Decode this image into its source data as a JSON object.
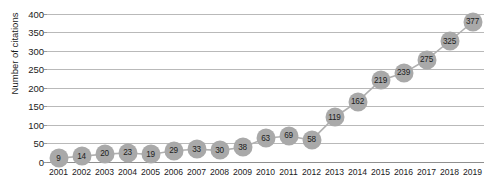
{
  "chart_data": {
    "type": "line",
    "title": "",
    "subtitle": "",
    "xlabel": "",
    "ylabel": "Number of citations",
    "ylim": [
      0,
      400
    ],
    "ytick_step": 50,
    "yticks": [
      "0",
      "50",
      "100",
      "150",
      "200",
      "250",
      "300",
      "350",
      "400"
    ],
    "grid": true,
    "legend": null,
    "legend_position": "none",
    "marker": "circle",
    "data_labels": true,
    "categories": [
      "2001",
      "2002",
      "2003",
      "2004",
      "2005",
      "2006",
      "2007",
      "2008",
      "2009",
      "2010",
      "2011",
      "2012",
      "2013",
      "2014",
      "2015",
      "2016",
      "2017",
      "2018",
      "2019"
    ],
    "values": [
      9,
      14,
      20,
      23,
      19,
      29,
      33,
      30,
      38,
      63,
      69,
      58,
      119,
      162,
      219,
      239,
      275,
      325,
      377
    ],
    "series": [
      {
        "name": "Number of citations",
        "values": [
          9,
          14,
          20,
          23,
          19,
          29,
          33,
          30,
          38,
          63,
          69,
          58,
          119,
          162,
          219,
          239,
          275,
          325,
          377
        ]
      }
    ],
    "colors": {
      "marker_fill": "#a9a9a9",
      "line": "#b0b0b0",
      "gridline": "#b9b9b9",
      "axis": "#8f8f8f",
      "label_text": "#212121",
      "tick_text": "#1b1b1b",
      "background": "#ffffff"
    }
  },
  "watermark": {
    "text": ""
  }
}
